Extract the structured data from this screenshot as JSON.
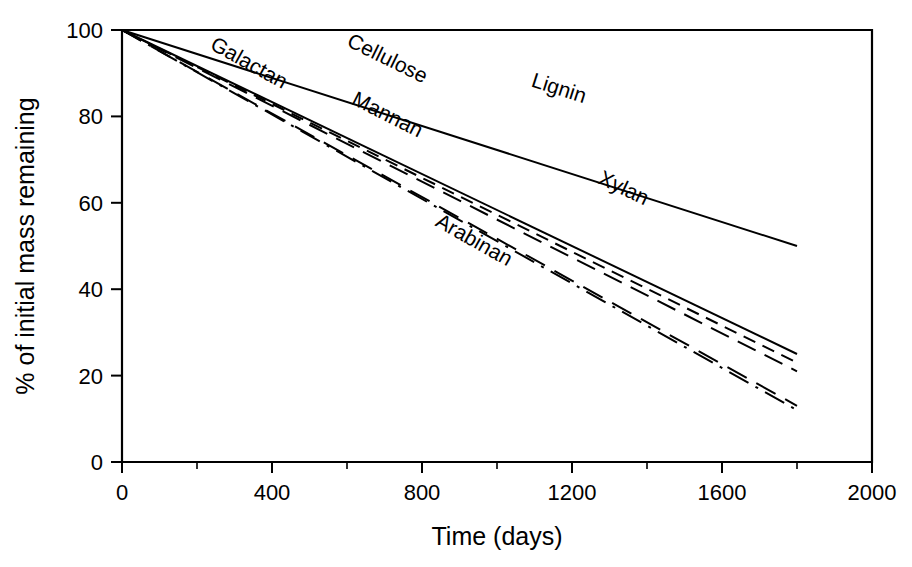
{
  "chart_data": {
    "type": "line",
    "title": "",
    "xlabel": "Time (days)",
    "ylabel": "% of initial mass remaining",
    "xlim": [
      0,
      2000
    ],
    "ylim": [
      0,
      100
    ],
    "xticks": [
      0,
      400,
      800,
      1200,
      1600,
      2000
    ],
    "xtick_labels": [
      "0",
      "400",
      "800",
      "1200",
      "1600",
      "2000"
    ],
    "xminor_ticks": [
      200,
      600,
      1000,
      1400,
      1800
    ],
    "yticks": [
      0,
      20,
      40,
      60,
      80,
      100
    ],
    "ytick_labels": [
      "0",
      "20",
      "40",
      "60",
      "80",
      "100"
    ],
    "grid": false,
    "legend": "inline-labels",
    "x": [
      0,
      1800
    ],
    "series": [
      {
        "name": "Lignin",
        "label": "Lignin",
        "linestyle": "solid",
        "dasharray": "none",
        "color": "#000000",
        "values": [
          100,
          50
        ],
        "label_x": 1160,
        "label_y": 85
      },
      {
        "name": "Xylan",
        "label": "Xylan",
        "linestyle": "solid",
        "dasharray": "none",
        "color": "#000000",
        "values": [
          100,
          25
        ],
        "label_x": 1330,
        "label_y": 62
      },
      {
        "name": "Cellulose",
        "label": "Cellulose",
        "linestyle": "dashed",
        "dasharray": "13,8",
        "color": "#000000",
        "values": [
          100,
          23
        ],
        "label_x": 700,
        "label_y": 92
      },
      {
        "name": "Mannan",
        "label": "Mannan",
        "linestyle": "long-dash",
        "dasharray": "20,10",
        "color": "#000000",
        "values": [
          100,
          21
        ],
        "label_x": 700,
        "label_y": 79
      },
      {
        "name": "Galactan",
        "label": "Galactan",
        "linestyle": "long-dash",
        "dasharray": "22,11",
        "color": "#000000",
        "values": [
          100,
          13
        ],
        "label_x": 330,
        "label_y": 91
      },
      {
        "name": "Arabinan",
        "label": "Arabinan",
        "linestyle": "dash-dot",
        "dasharray": "22,8,3,8",
        "color": "#000000",
        "values": [
          100,
          12
        ],
        "label_x": 930,
        "label_y": 50
      }
    ]
  }
}
